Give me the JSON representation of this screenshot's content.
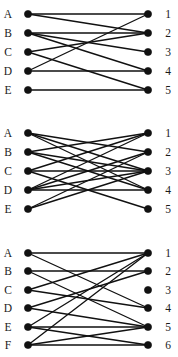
{
  "figure": {
    "type": "bipartite-graph-set",
    "panel_count": 3,
    "node_radius": 3.6,
    "left_x": 28,
    "right_x": 148,
    "left_label_x": 8,
    "right_label_x": 168
  },
  "panels": [
    {
      "id": "panel-1",
      "left_labels": [
        "A",
        "B",
        "C",
        "D",
        "E"
      ],
      "right_labels": [
        "1",
        "2",
        "3",
        "4",
        "5"
      ],
      "left_y": [
        14,
        33,
        52,
        71,
        90
      ],
      "right_y": [
        14,
        33,
        52,
        71,
        90
      ],
      "edges": [
        {
          "from": 0,
          "to": 0
        },
        {
          "from": 0,
          "to": 1
        },
        {
          "from": 1,
          "to": 1
        },
        {
          "from": 1,
          "to": 2
        },
        {
          "from": 1,
          "to": 3
        },
        {
          "from": 2,
          "to": 1
        },
        {
          "from": 2,
          "to": 4
        },
        {
          "from": 3,
          "to": 0
        },
        {
          "from": 3,
          "to": 3
        },
        {
          "from": 4,
          "to": 4
        }
      ]
    },
    {
      "id": "panel-2",
      "left_labels": [
        "A",
        "B",
        "C",
        "D",
        "E"
      ],
      "right_labels": [
        "1",
        "2",
        "3",
        "4",
        "5"
      ],
      "left_y": [
        133,
        152,
        171,
        190,
        209
      ],
      "right_y": [
        133,
        152,
        171,
        190,
        209
      ],
      "edges": [
        {
          "from": 0,
          "to": 1
        },
        {
          "from": 0,
          "to": 2
        },
        {
          "from": 0,
          "to": 3
        },
        {
          "from": 1,
          "to": 0
        },
        {
          "from": 1,
          "to": 2
        },
        {
          "from": 1,
          "to": 3
        },
        {
          "from": 2,
          "to": 0
        },
        {
          "from": 2,
          "to": 2
        },
        {
          "from": 2,
          "to": 4
        },
        {
          "from": 3,
          "to": 0
        },
        {
          "from": 3,
          "to": 1
        },
        {
          "from": 3,
          "to": 2
        },
        {
          "from": 3,
          "to": 3
        },
        {
          "from": 4,
          "to": 1
        },
        {
          "from": 4,
          "to": 2
        }
      ]
    },
    {
      "id": "panel-3",
      "left_labels": [
        "A",
        "B",
        "C",
        "D",
        "E",
        "F"
      ],
      "right_labels": [
        "1",
        "2",
        "3",
        "4",
        "5",
        "6"
      ],
      "left_y": [
        253,
        271,
        290,
        308,
        327,
        345
      ],
      "right_y": [
        253,
        271,
        290,
        308,
        327,
        345
      ],
      "edges": [
        {
          "from": 0,
          "to": 0
        },
        {
          "from": 0,
          "to": 3
        },
        {
          "from": 1,
          "to": 1
        },
        {
          "from": 1,
          "to": 4
        },
        {
          "from": 2,
          "to": 0
        },
        {
          "from": 2,
          "to": 3
        },
        {
          "from": 3,
          "to": 1
        },
        {
          "from": 3,
          "to": 4
        },
        {
          "from": 4,
          "to": 0
        },
        {
          "from": 4,
          "to": 4
        },
        {
          "from": 4,
          "to": 5
        },
        {
          "from": 5,
          "to": 0
        },
        {
          "from": 5,
          "to": 4
        },
        {
          "from": 5,
          "to": 5
        }
      ]
    }
  ]
}
